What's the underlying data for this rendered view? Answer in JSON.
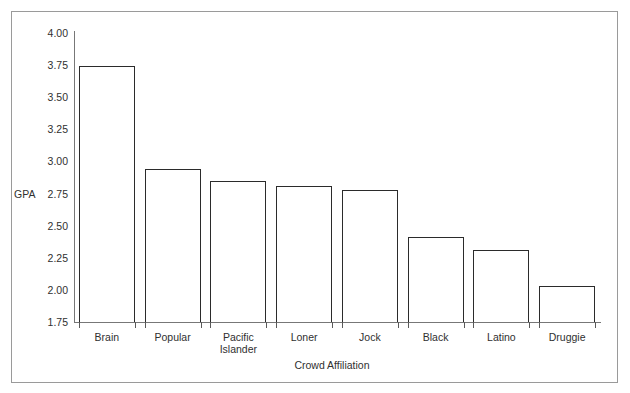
{
  "chart_data": {
    "type": "bar",
    "title": "",
    "xlabel": "Crowd Affiliation",
    "ylabel": "GPA",
    "categories": [
      "Brain",
      "Popular",
      "Pacific\nIslander",
      "Loner",
      "Jock",
      "Black",
      "Latino",
      "Druggie"
    ],
    "values": [
      3.74,
      2.94,
      2.85,
      2.81,
      2.78,
      2.41,
      2.31,
      2.03
    ],
    "ylim": [
      1.75,
      4.0
    ],
    "ytick_labels": [
      "4.00",
      "3.75",
      "3.50",
      "3.25",
      "3.00",
      "2.75",
      "2.50",
      "2.25",
      "2.00",
      "1.75"
    ],
    "ytick_values": [
      4.0,
      3.75,
      3.5,
      3.25,
      3.0,
      2.75,
      2.5,
      2.25,
      2.0,
      1.75
    ],
    "grid": false,
    "legend": false,
    "legend_position": "none",
    "bar_fill": "#ffffff",
    "bar_edge": "#2b2b2b",
    "axis_color": "#777777",
    "frame_color": "#9a9a9a",
    "background": "#ffffff",
    "ylabel_anchor_value": 2.75
  }
}
